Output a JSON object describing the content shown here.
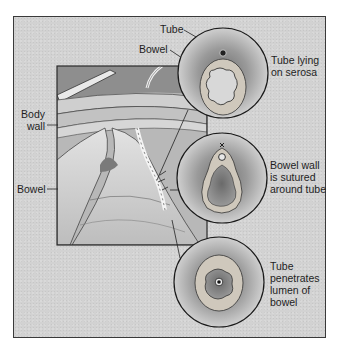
{
  "figure": {
    "type": "surgical-illustration",
    "colors": {
      "background": "#d2d2d2",
      "frame": "#3a3a3a",
      "ink": "#1e1e1e"
    }
  },
  "labels": {
    "tube_top": "Tube",
    "bowel_top": "Bowel",
    "body_wall": "Body\nwall",
    "bowel_left": "Bowel",
    "inset1_caption": "Tube lying\non serosa",
    "inset2_caption": "Bowel wall\nis sutured\naround tube",
    "inset3_caption": "Tube\npenetrates\nlumen of\nbowel"
  },
  "insets": [
    {
      "name": "inset-tube-on-serosa",
      "caption_key": "inset1_caption"
    },
    {
      "name": "inset-wall-sutured",
      "caption_key": "inset2_caption"
    },
    {
      "name": "inset-tube-in-lumen",
      "caption_key": "inset3_caption"
    }
  ]
}
